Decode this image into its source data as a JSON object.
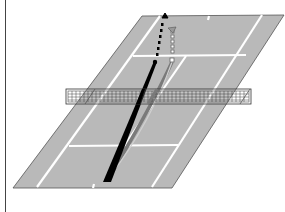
{
  "diagram": {
    "title": "",
    "colors": {
      "background": "#ffffff",
      "court": "#b9b9b9",
      "court_lines": "#ffffff",
      "court_outline": "#555555",
      "net_mesh": "#333333",
      "trajectory_primary": "#000000",
      "trajectory_secondary": "#8a8a8a"
    },
    "elements": [
      {
        "id": "court",
        "label": "tennis-court"
      },
      {
        "id": "net",
        "label": "net"
      },
      {
        "id": "trajectory-1",
        "label": "solid black shot path with dotted continuation and arrowhead"
      },
      {
        "id": "trajectory-2",
        "label": "grey curved shot path with square-dotted continuation and arrowhead"
      }
    ]
  }
}
